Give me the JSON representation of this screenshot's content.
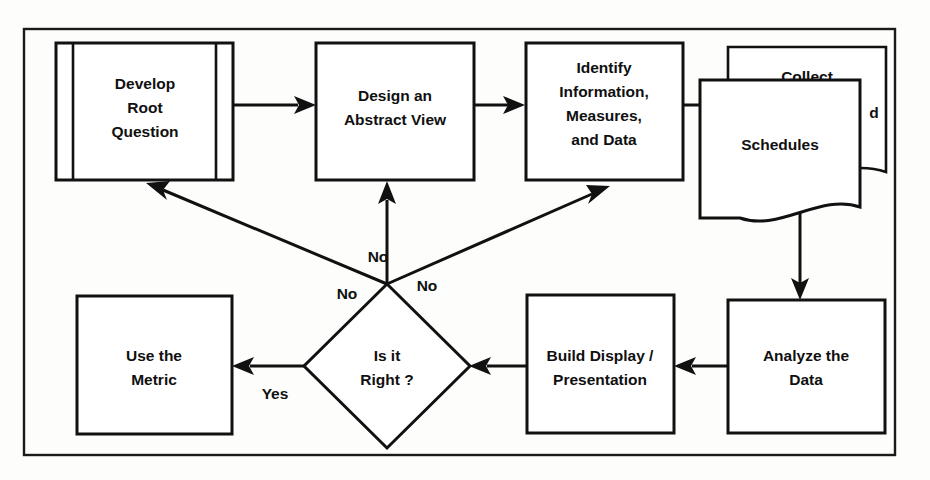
{
  "diagram": {
    "background_color": "#fdfdfb",
    "line_color": "#111111",
    "shape_fill": "#ffffff",
    "nodes": [
      {
        "id": "develop-root-question",
        "shape": "predefined-process",
        "lines": [
          "Develop",
          "Root",
          "Question"
        ]
      },
      {
        "id": "design-abstract-view",
        "shape": "process",
        "lines": [
          "Design an",
          "Abstract View"
        ]
      },
      {
        "id": "identify-information",
        "shape": "process",
        "lines": [
          "Identify",
          "Information,",
          "Measures,",
          "and Data"
        ]
      },
      {
        "id": "collect-back-document",
        "shape": "document",
        "lines": [
          "Collect",
          "d"
        ]
      },
      {
        "id": "schedules-document",
        "shape": "document",
        "lines": [
          "Schedules"
        ]
      },
      {
        "id": "analyze-the-data",
        "shape": "process",
        "lines": [
          "Analyze the",
          "Data"
        ]
      },
      {
        "id": "build-display-presentation",
        "shape": "process",
        "lines": [
          "Build Display /",
          "Presentation"
        ]
      },
      {
        "id": "is-it-right",
        "shape": "decision",
        "lines": [
          "Is it",
          "Right ?"
        ]
      },
      {
        "id": "use-the-metric",
        "shape": "process",
        "lines": [
          "Use the",
          "Metric"
        ]
      }
    ],
    "edge_labels": {
      "no_left": "No",
      "no_center": "No",
      "no_right": "No",
      "yes": "Yes"
    }
  }
}
